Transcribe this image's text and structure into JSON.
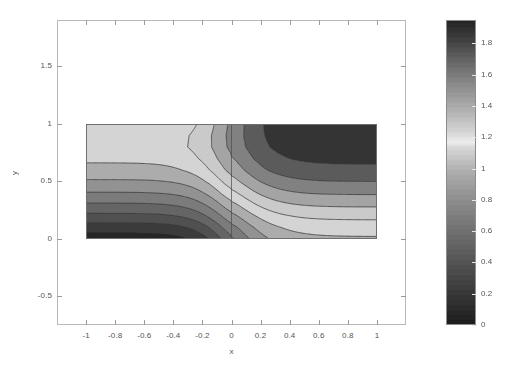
{
  "figure": {
    "width": 506,
    "height": 388,
    "background": "#ffffff",
    "axes_color": "#b9b9b9",
    "text_color": "#555555"
  },
  "axes": {
    "left": 57,
    "top": 20,
    "right": 406,
    "bottom": 325,
    "xlim": [
      -1.2,
      1.2
    ],
    "ylim": [
      -0.75,
      1.9
    ]
  },
  "colorbar": {
    "left": 446,
    "top": 20,
    "right": 476,
    "bottom": 325,
    "vmin": 0,
    "vmax": 1.95,
    "ticks": [
      0,
      0.2,
      0.4,
      0.6,
      0.8,
      1,
      1.2,
      1.4,
      1.6,
      1.8
    ],
    "tick_labels": [
      "0",
      "0.2",
      "0.4",
      "0.6",
      "0.8",
      "1",
      "1.2",
      "1.4",
      "1.6",
      "1.8"
    ]
  },
  "chart_data": {
    "type": "heatmap",
    "title": "",
    "xlabel": "x",
    "ylabel": "y",
    "xlim": [
      -1.2,
      1.2
    ],
    "ylim": [
      -0.75,
      1.9
    ],
    "xticks": [
      -1,
      -0.8,
      -0.6,
      -0.4,
      -0.2,
      0,
      0.2,
      0.4,
      0.6,
      0.8,
      1
    ],
    "xtick_labels": [
      "-1",
      "-0.8",
      "-0.6",
      "-0.4",
      "-0.2",
      "0",
      "0.2",
      "0.4",
      "0.6",
      "0.8",
      "1"
    ],
    "yticks": [
      -0.5,
      0,
      0.5,
      1,
      1.5
    ],
    "ytick_labels": [
      "-0.5",
      "0",
      "0.5",
      "1",
      "1.5"
    ],
    "grid": false,
    "legend": "none",
    "colorbar_label": "",
    "domain": {
      "x": [
        -1,
        1
      ],
      "y": [
        0,
        1
      ]
    },
    "zmin": 0,
    "zmax": 1.95,
    "colormap": "diverging-gray",
    "colormap_stops": [
      {
        "t": 0.0,
        "gray": 28
      },
      {
        "t": 0.12,
        "gray": 60
      },
      {
        "t": 0.25,
        "gray": 96
      },
      {
        "t": 0.38,
        "gray": 132
      },
      {
        "t": 0.5,
        "gray": 172
      },
      {
        "t": 0.58,
        "gray": 214
      },
      {
        "t": 0.6,
        "gray": 237
      },
      {
        "t": 0.63,
        "gray": 214
      },
      {
        "t": 0.7,
        "gray": 178
      },
      {
        "t": 0.78,
        "gray": 142
      },
      {
        "t": 0.86,
        "gray": 104
      },
      {
        "t": 0.93,
        "gray": 66
      },
      {
        "t": 1.0,
        "gray": 34
      }
    ],
    "contour_levels": [
      0.15,
      0.3,
      0.45,
      0.6,
      0.75,
      0.9,
      1.05,
      1.2,
      1.35,
      1.5,
      1.65,
      1.8
    ],
    "contour_color": "#3b3b3b",
    "discontinuity_x": 0,
    "field_description": "Two-branch scalar field with a jump across x=0. Left branch increases from low values at y=0 to a bright maximum near y=0.85 then dips slightly at the top edge; bands are horizontal far from the seam and bend sharply upward approaching x=0. Right branch is inverted, rising monotonically from ~1.05 at y=0 to ~1.95 at y=1, with bands flattening out toward x=1.",
    "left_branch_edge_profile": {
      "y": [
        0,
        0.1,
        0.2,
        0.3,
        0.4,
        0.5,
        0.6,
        0.7,
        0.8,
        0.9,
        1.0
      ],
      "z": [
        0.05,
        0.22,
        0.41,
        0.58,
        0.74,
        0.88,
        1.0,
        1.08,
        1.13,
        1.12,
        1.07
      ]
    },
    "right_branch_edge_profile": {
      "y": [
        0,
        0.1,
        0.2,
        0.3,
        0.4,
        0.5,
        0.6,
        0.7,
        0.8,
        0.9,
        1.0
      ],
      "z": [
        1.03,
        1.12,
        1.24,
        1.38,
        1.52,
        1.65,
        1.76,
        1.84,
        1.9,
        1.93,
        1.95
      ]
    }
  }
}
